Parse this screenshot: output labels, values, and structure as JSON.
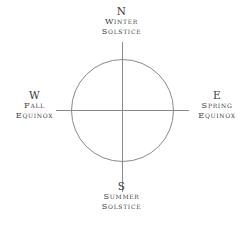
{
  "diagram": {
    "type": "seasonal-compass-rose",
    "background_color": "#ffffff",
    "stroke_color": "#8a8a8a",
    "text_color": "#3b3b3b",
    "circle": {
      "center_x": 122,
      "center_y": 110,
      "radius": 51
    },
    "axes": {
      "horizontal": {
        "x1": 56,
        "y1": 110,
        "x2": 189,
        "y2": 110
      },
      "vertical": {
        "x1": 122,
        "y1": 42,
        "x2": 122,
        "y2": 192
      }
    },
    "labels": {
      "north": {
        "cardinal": "N",
        "line1": "Winter",
        "line2": "Solstice"
      },
      "south": {
        "cardinal": "S",
        "line1": "Summer",
        "line2": "Solstice"
      },
      "west": {
        "cardinal": "W",
        "line1": "Fall",
        "line2": "Equinox"
      },
      "east": {
        "cardinal": "E",
        "line1": "Spring",
        "line2": "Equinox"
      }
    }
  }
}
